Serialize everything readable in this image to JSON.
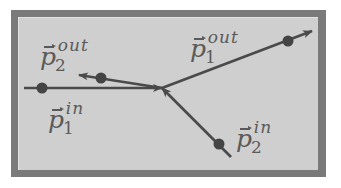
{
  "diagram": {
    "type": "particle-collision",
    "colors": {
      "frame": "#7a7a7a",
      "panel": "#cfcfcf",
      "line": "#4a4a4a",
      "dot": "#444444",
      "text": "#5a5a5a"
    },
    "vertex": {
      "x": 162,
      "y": 88
    },
    "vectors": [
      {
        "id": "p1_in",
        "symbol": "p",
        "subscript": "1",
        "superscript": "in",
        "direction": "incoming",
        "from": {
          "x": 24,
          "y": 88
        },
        "to": {
          "x": 162,
          "y": 88
        },
        "dot": {
          "x": 42,
          "y": 88
        }
      },
      {
        "id": "p2_in",
        "symbol": "p",
        "subscript": "2",
        "superscript": "in",
        "direction": "incoming",
        "from": {
          "x": 231,
          "y": 157
        },
        "to": {
          "x": 162,
          "y": 88
        },
        "dot": {
          "x": 219,
          "y": 144
        }
      },
      {
        "id": "p1_out",
        "symbol": "p",
        "subscript": "1",
        "superscript": "out",
        "direction": "outgoing",
        "from": {
          "x": 162,
          "y": 88
        },
        "to": {
          "x": 312,
          "y": 31
        },
        "dot": {
          "x": 288,
          "y": 41
        }
      },
      {
        "id": "p2_out",
        "symbol": "p",
        "subscript": "2",
        "superscript": "out",
        "direction": "outgoing",
        "from": {
          "x": 162,
          "y": 88
        },
        "to": {
          "x": 79,
          "y": 75
        },
        "dot": {
          "x": 101,
          "y": 78
        }
      }
    ]
  },
  "labels": {
    "p1_in": {
      "symbol": "p",
      "sub": "1",
      "sup": "in"
    },
    "p2_in": {
      "symbol": "p",
      "sub": "2",
      "sup": "in"
    },
    "p1_out": {
      "symbol": "p",
      "sub": "1",
      "sup": "out"
    },
    "p2_out": {
      "symbol": "p",
      "sub": "2",
      "sup": "out"
    }
  }
}
